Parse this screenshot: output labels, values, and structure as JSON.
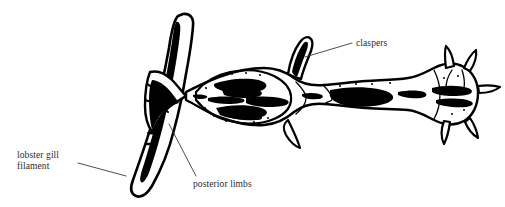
{
  "figure": {
    "kind": "scientific-line-drawing",
    "background_color": "#ffffff",
    "ink_color": "#000000",
    "label_color": "#2b2b2b",
    "leader_color": "#3a3a3a",
    "width": 505,
    "height": 207
  },
  "labels": {
    "claspers": "claspers",
    "lobster_gill_filament_line1": "lobster gill",
    "lobster_gill_filament_line2": "filament",
    "posterior_limbs": "posterior limbs"
  },
  "leaders": [
    {
      "name": "claspers-leader",
      "from": [
        352,
        43
      ],
      "to": [
        305,
        57
      ]
    },
    {
      "name": "lobster-gill-filament-leader",
      "from": [
        78,
        163
      ],
      "to": [
        126,
        176
      ]
    },
    {
      "name": "posterior-limbs-leader",
      "from": [
        196,
        176
      ],
      "to": [
        169,
        124
      ]
    }
  ],
  "anatomy": {
    "gill_filament": "vertical tapering tube running from top centre-left down to lower left, the host structure",
    "body": "elongate horizontal body with bulbous anterior sac, narrow abdomen and rounded posterior segment",
    "claspers": "curved hook-like appendage projecting up from the dorsal surface",
    "posterior_limbs": "paired limbs at the attachment point gripping the gill filament",
    "spines": "radiating pointed spines around the rounded right-hand segment",
    "internal_detail": "irregular dark blotches and stipple marking internal organs"
  }
}
